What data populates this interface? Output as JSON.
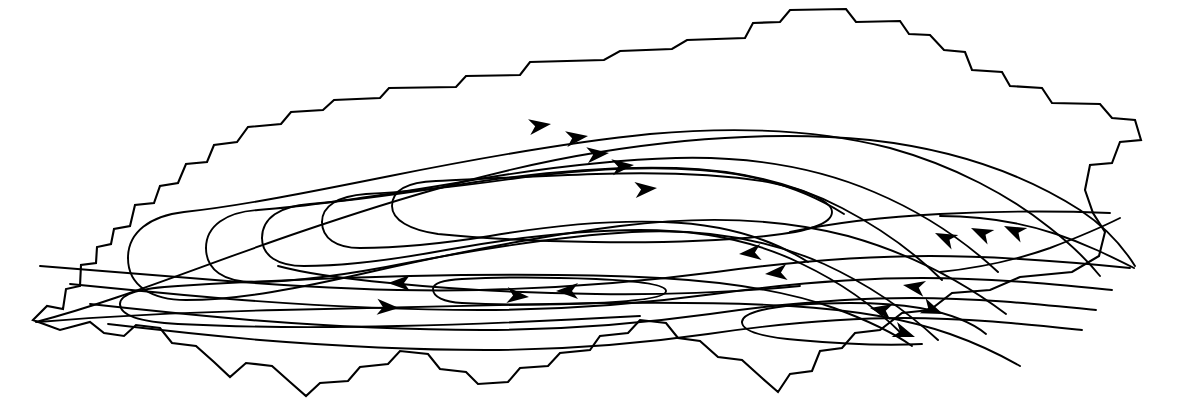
{
  "figure": {
    "title": "Circulation streamline pattern within basin outline",
    "type": "streamline-contour-map",
    "width": 1178,
    "height": 401,
    "background_color": "#ffffff",
    "line_color": "#000000",
    "boundary_stroke_width": 2.1,
    "streamline_stroke_width": 1.9,
    "arrow_count": 18,
    "streamline_count": 14,
    "closed_loop_count": 4
  },
  "chart_data": {
    "type": "line",
    "title": "Circulation streamline pattern within basin outline",
    "subtitle": "",
    "xlabel": "",
    "ylabel": "",
    "grid": false,
    "legend": "none",
    "xlim": [
      0,
      1178
    ],
    "ylim": [
      0,
      401
    ],
    "boundary": {
      "name": "basin-outline",
      "vertex_count": 62,
      "style": "jagged-polygonal",
      "points": [
        [
          33,
          320
        ],
        [
          47,
          306
        ],
        [
          63,
          309
        ],
        [
          66,
          289
        ],
        [
          80,
          286
        ],
        [
          81,
          265
        ],
        [
          96,
          263
        ],
        [
          97,
          247
        ],
        [
          111,
          244
        ],
        [
          114,
          229
        ],
        [
          130,
          226
        ],
        [
          135,
          205
        ],
        [
          154,
          203
        ],
        [
          160,
          186
        ],
        [
          178,
          183
        ],
        [
          186,
          164
        ],
        [
          207,
          162
        ],
        [
          214,
          145
        ],
        [
          237,
          142
        ],
        [
          248,
          127
        ],
        [
          281,
          124
        ],
        [
          291,
          112
        ],
        [
          323,
          110
        ],
        [
          334,
          100
        ],
        [
          380,
          98
        ],
        [
          389,
          88
        ],
        [
          456,
          87
        ],
        [
          466,
          76
        ],
        [
          520,
          75
        ],
        [
          530,
          62
        ],
        [
          604,
          60
        ],
        [
          620,
          51
        ],
        [
          672,
          49
        ],
        [
          687,
          40
        ],
        [
          745,
          38
        ],
        [
          753,
          23
        ],
        [
          780,
          22
        ],
        [
          790,
          10
        ],
        [
          846,
          9
        ],
        [
          856,
          22
        ],
        [
          900,
          21
        ],
        [
          909,
          34
        ],
        [
          930,
          35
        ],
        [
          944,
          50
        ],
        [
          965,
          52
        ],
        [
          972,
          70
        ],
        [
          1002,
          72
        ],
        [
          1010,
          86
        ],
        [
          1042,
          88
        ],
        [
          1052,
          103
        ],
        [
          1100,
          104
        ],
        [
          1112,
          118
        ],
        [
          1135,
          120
        ],
        [
          1141,
          140
        ],
        [
          1120,
          142
        ],
        [
          1112,
          163
        ],
        [
          1090,
          165
        ],
        [
          1085,
          190
        ],
        [
          1093,
          213
        ],
        [
          1105,
          232
        ],
        [
          1099,
          256
        ],
        [
          1072,
          272
        ],
        [
          1020,
          277
        ],
        [
          990,
          290
        ],
        [
          952,
          293
        ],
        [
          930,
          310
        ],
        [
          902,
          313
        ],
        [
          880,
          330
        ],
        [
          855,
          333
        ],
        [
          842,
          348
        ],
        [
          820,
          351
        ],
        [
          812,
          371
        ],
        [
          790,
          374
        ],
        [
          778,
          392
        ],
        [
          762,
          378
        ],
        [
          742,
          360
        ],
        [
          718,
          357
        ],
        [
          700,
          341
        ],
        [
          678,
          338
        ],
        [
          666,
          323
        ],
        [
          640,
          320
        ],
        [
          628,
          333
        ],
        [
          600,
          336
        ],
        [
          590,
          350
        ],
        [
          560,
          353
        ],
        [
          548,
          366
        ],
        [
          520,
          368
        ],
        [
          508,
          382
        ],
        [
          478,
          384
        ],
        [
          466,
          372
        ],
        [
          440,
          369
        ],
        [
          428,
          354
        ],
        [
          400,
          351
        ],
        [
          388,
          364
        ],
        [
          360,
          367
        ],
        [
          348,
          381
        ],
        [
          320,
          383
        ],
        [
          306,
          396
        ],
        [
          290,
          382
        ],
        [
          272,
          366
        ],
        [
          246,
          363
        ],
        [
          230,
          377
        ],
        [
          214,
          362
        ],
        [
          196,
          346
        ],
        [
          172,
          343
        ],
        [
          160,
          328
        ],
        [
          136,
          325
        ],
        [
          124,
          336
        ],
        [
          104,
          333
        ],
        [
          90,
          322
        ],
        [
          60,
          330
        ]
      ]
    },
    "streamlines": [
      {
        "id": "sl-01-outer-north",
        "direction": "eastward",
        "note": "outermost northern streamline running from far west tip along the north shore to the northeast lobe"
      },
      {
        "id": "sl-02-north",
        "direction": "eastward",
        "note": "second northern streamline, closes into the west-pointing nose near x=150"
      },
      {
        "id": "sl-03-north",
        "direction": "eastward",
        "note": "third northern streamline"
      },
      {
        "id": "sl-04-north",
        "direction": "eastward",
        "note": "fourth northern streamline"
      },
      {
        "id": "sl-05-north-core",
        "direction": "eastward",
        "note": "innermost northern streamline ending in the elongated core nose near x=310"
      },
      {
        "id": "sl-06-core-loop",
        "direction": "closed",
        "note": "closed elongated core loop of the upper gyre, centered near (520,200)"
      },
      {
        "id": "sl-07-central-return",
        "direction": "westward",
        "note": "central return band streamline flowing west"
      },
      {
        "id": "sl-08-central-return",
        "direction": "westward",
        "note": "central return band streamline flowing west"
      },
      {
        "id": "sl-09-central-return",
        "direction": "westward",
        "note": "central return band streamline flowing west"
      },
      {
        "id": "sl-10-central-return",
        "direction": "westward",
        "note": "central return band streamline flowing west"
      },
      {
        "id": "sl-11-eddy-loop",
        "direction": "closed",
        "note": "small closed eddy loop in lower-middle region centered near (545,291)"
      },
      {
        "id": "sl-12-south",
        "direction": "eastward",
        "note": "southern limb streamline flowing east"
      },
      {
        "id": "sl-13-south",
        "direction": "eastward",
        "note": "southern limb streamline flowing east"
      },
      {
        "id": "sl-14-south-loop",
        "direction": "closed",
        "note": "closed elongated loop along the southwestern limb"
      }
    ],
    "arrows": [
      {
        "id": "arrow-01",
        "x": 551,
        "y": 124,
        "angle": -8,
        "direction": "east",
        "gyre": "north"
      },
      {
        "id": "arrow-02",
        "x": 588,
        "y": 136,
        "angle": -8,
        "direction": "east",
        "gyre": "north"
      },
      {
        "id": "arrow-03",
        "x": 609,
        "y": 153,
        "angle": -6,
        "direction": "east",
        "gyre": "north"
      },
      {
        "id": "arrow-04",
        "x": 634,
        "y": 165,
        "angle": -6,
        "direction": "east",
        "gyre": "north"
      },
      {
        "id": "arrow-05",
        "x": 657,
        "y": 188,
        "angle": -5,
        "direction": "east",
        "gyre": "north"
      },
      {
        "id": "arrow-06",
        "x": 739,
        "y": 254,
        "angle": 175,
        "direction": "west",
        "gyre": "central-return"
      },
      {
        "id": "arrow-07",
        "x": 765,
        "y": 274,
        "angle": 175,
        "direction": "west",
        "gyre": "central-return"
      },
      {
        "id": "arrow-08",
        "x": 388,
        "y": 283,
        "angle": 180,
        "direction": "west",
        "gyre": "central-return"
      },
      {
        "id": "arrow-09",
        "x": 556,
        "y": 291,
        "angle": 180,
        "direction": "west",
        "gyre": "eddy-loop"
      },
      {
        "id": "arrow-10",
        "x": 529,
        "y": 297,
        "angle": 5,
        "direction": "east",
        "gyre": "eddy-loop"
      },
      {
        "id": "arrow-11",
        "x": 399,
        "y": 308,
        "angle": 3,
        "direction": "east",
        "gyre": "south"
      },
      {
        "id": "arrow-12",
        "x": 935,
        "y": 233,
        "angle": 205,
        "direction": "northwest",
        "gyre": "east-turn"
      },
      {
        "id": "arrow-13",
        "x": 971,
        "y": 228,
        "angle": 205,
        "direction": "northwest",
        "gyre": "east-turn"
      },
      {
        "id": "arrow-14",
        "x": 1004,
        "y": 226,
        "angle": 205,
        "direction": "northwest",
        "gyre": "east-turn"
      },
      {
        "id": "arrow-15",
        "x": 903,
        "y": 285,
        "angle": 190,
        "direction": "west",
        "gyre": "south-return"
      },
      {
        "id": "arrow-16",
        "x": 870,
        "y": 308,
        "angle": 190,
        "direction": "west",
        "gyre": "south-return"
      },
      {
        "id": "arrow-17",
        "x": 943,
        "y": 314,
        "angle": 22,
        "direction": "southeast",
        "gyre": "south"
      },
      {
        "id": "arrow-18",
        "x": 915,
        "y": 337,
        "angle": 20,
        "direction": "southeast",
        "gyre": "south"
      }
    ]
  }
}
